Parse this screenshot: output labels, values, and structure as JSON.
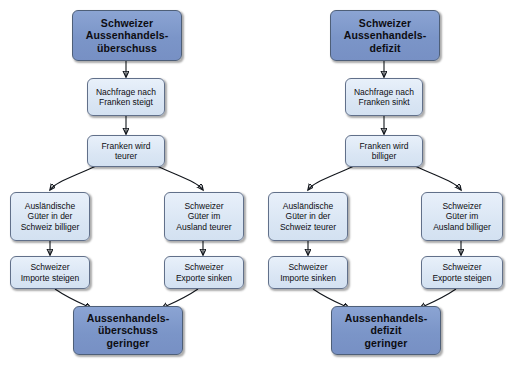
{
  "diagram": {
    "background_color": "#ffffff",
    "primary_box_color": "#7b95c8",
    "step_box_color": "#dce7f5",
    "border_color": "#5b6a80",
    "arrow_color": "#12161c",
    "flows": [
      {
        "id": "surplus",
        "name": "Schweizer Aussenhandelsüberschuss",
        "head": "Schweizer\nAussenhandels-\nüberschuss",
        "demand": "Nachfrage nach\nFranken steigt",
        "currency": "Franken wird\nteurer",
        "left_effect": "Ausländische\nGüter in der\nSchweiz billiger",
        "right_effect": "Schweizer\nGüter im\nAusland teurer",
        "left_result": "Schweizer\nImporte steigen",
        "right_result": "Schweizer\nExporte sinken",
        "conclusion": "Aussenhandels-\nüberschuss\ngeringer"
      },
      {
        "id": "deficit",
        "name": "Schweizer Aussenhandelsdefizit",
        "head": "Schweizer\nAussenhandels-\ndefizit",
        "demand": "Nachfrage nach\nFranken sinkt",
        "currency": "Franken wird\nbilliger",
        "left_effect": "Ausländische\nGüter in der\nSchweiz teurer",
        "right_effect": "Schweizer\nGüter im\nAusland billiger",
        "left_result": "Schweizer\nImporte sinken",
        "right_result": "Schweizer\nExporte steigen",
        "conclusion": "Aussenhandels-\ndefizit\ngeringer"
      }
    ]
  }
}
